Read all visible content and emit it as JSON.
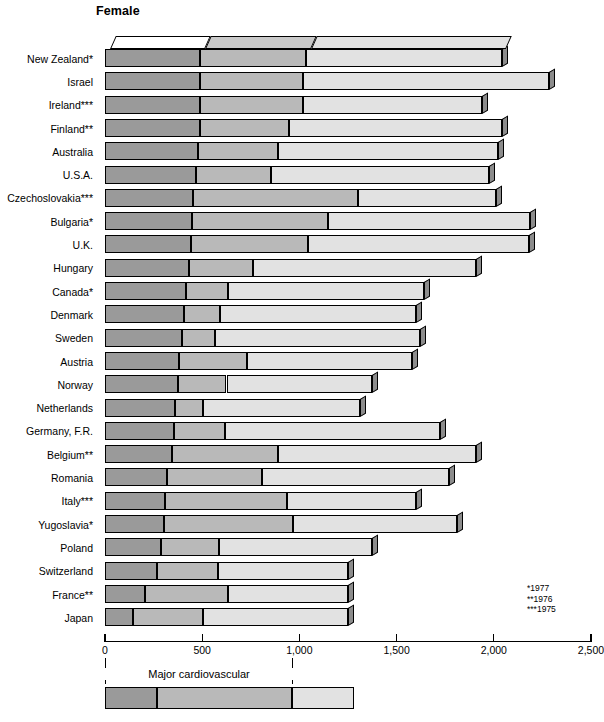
{
  "chart": {
    "title": "Female",
    "footnotes": [
      "*1977",
      "**1976",
      "***1975"
    ],
    "legend_label": "Major cardiovascular"
  },
  "axis": {
    "ticks": [
      "0",
      "500",
      "1,000",
      "1,500",
      "2,000",
      "2,500"
    ],
    "min": 0,
    "max": 2500
  },
  "colors": {
    "segment1": "#9a9a9a",
    "segment2": "#b9b9b9",
    "segment3": "#e2e2e2",
    "outline": "#000000"
  },
  "chart_data": {
    "type": "bar",
    "orientation": "horizontal",
    "stacked": true,
    "title": "Female",
    "xlabel": "",
    "ylabel": "",
    "xlim": [
      0,
      2500
    ],
    "grid": false,
    "legend_position": "bottom",
    "series": [
      {
        "name": "Ischaemic heart disease",
        "color": "#9a9a9a"
      },
      {
        "name": "Other major cardiovascular",
        "color": "#b9b9b9"
      },
      {
        "name": "All other causes",
        "color": "#e2e2e2"
      }
    ],
    "legend_bracket": {
      "label": "Major cardiovascular",
      "covers": [
        0,
        1
      ],
      "extent": [
        0,
        960
      ]
    },
    "categories": [
      "New Zealand*",
      "Israel",
      "Ireland***",
      "Finland**",
      "Australia",
      "U.S.A.",
      "Czechoslovakia***",
      "Bulgaria*",
      "U.K.",
      "Hungary",
      "Canada*",
      "Denmark",
      "Sweden",
      "Austria",
      "Norway",
      "Netherlands",
      "Germany, F.R.",
      "Belgium**",
      "Romania",
      "Italy***",
      "Yugoslavia*",
      "Poland",
      "Switzerland",
      "France**",
      "Japan"
    ],
    "values": [
      [
        490,
        545,
        1005
      ],
      [
        490,
        530,
        1265
      ],
      [
        490,
        530,
        920
      ],
      [
        490,
        455,
        1095
      ],
      [
        480,
        410,
        1130
      ],
      [
        470,
        385,
        1120
      ],
      [
        455,
        845,
        710
      ],
      [
        445,
        700,
        1040
      ],
      [
        440,
        605,
        1135
      ],
      [
        430,
        330,
        1150
      ],
      [
        415,
        220,
        1005
      ],
      [
        405,
        185,
        1010
      ],
      [
        395,
        170,
        1055
      ],
      [
        380,
        350,
        850
      ],
      [
        375,
        250,
        750
      ],
      [
        360,
        145,
        805
      ],
      [
        355,
        260,
        1110
      ],
      [
        345,
        545,
        1020
      ],
      [
        320,
        490,
        960
      ],
      [
        310,
        625,
        665
      ],
      [
        305,
        660,
        845
      ],
      [
        290,
        295,
        790
      ],
      [
        265,
        315,
        670
      ],
      [
        205,
        430,
        615
      ],
      [
        145,
        360,
        745
      ]
    ],
    "totals": [
      2040,
      2285,
      1940,
      2040,
      2020,
      1975,
      2010,
      2185,
      2180,
      1910,
      1640,
      1600,
      1620,
      1580,
      1375,
      1310,
      1725,
      1910,
      1770,
      1600,
      1810,
      1375,
      1250,
      1250,
      1250
    ]
  },
  "notes": {
    "note_footnote_mapping": [
      "* = 1977",
      "** = 1976",
      "*** = 1975"
    ]
  }
}
